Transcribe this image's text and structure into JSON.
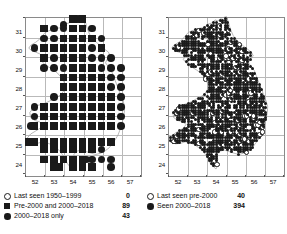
{
  "figure": {
    "type": "distribution-map-pair"
  },
  "maps": [
    {
      "id": "left-map",
      "name": "left-distribution-map",
      "axis": {
        "x_ticks": [
          "52",
          "53",
          "54",
          "55",
          "56",
          "57"
        ],
        "y_ticks": [
          "31",
          "30",
          "29",
          "28",
          "27",
          "26",
          "25",
          "24"
        ],
        "xlim": [
          51.5,
          57.5
        ],
        "ylim": [
          23.5,
          31.6
        ],
        "grid": true
      },
      "legend": [
        {
          "symbol": "open-circle",
          "label": "Last seen 1950–1999",
          "count": "0"
        },
        {
          "symbol": "filled-square",
          "label": "Pre-2000 and 2000–2018",
          "count": "89"
        },
        {
          "symbol": "filled-circle",
          "label": "2000–2018 only",
          "count": "43"
        }
      ]
    },
    {
      "id": "right-map",
      "name": "right-distribution-map",
      "axis": {
        "x_ticks": [
          "52",
          "53",
          "54",
          "55",
          "56",
          "57"
        ],
        "y_ticks": [
          "31",
          "30",
          "29",
          "28",
          "27",
          "26",
          "25",
          "24"
        ],
        "xlim": [
          51.5,
          57.5
        ],
        "ylim": [
          23.5,
          31.6
        ],
        "grid": true
      },
      "legend": [
        {
          "symbol": "open-circle",
          "label": "Last seen pre-2000",
          "count": "40"
        },
        {
          "symbol": "filled-circle",
          "label": "Seen 2000–2018",
          "count": "394"
        }
      ]
    }
  ],
  "chart_data": {
    "type": "scatter",
    "title": "",
    "xlabel": "",
    "ylabel": "",
    "xlim": [
      51.5,
      57.5
    ],
    "ylim": [
      23.5,
      31.6
    ],
    "grid": true,
    "panels": [
      {
        "name": "left-map",
        "series": [
          {
            "name": "Last seen 1950–1999",
            "symbol": "open-circle",
            "count": 0,
            "points": []
          },
          {
            "name": "Pre-2000 and 2000–2018",
            "symbol": "filled-square",
            "count": 89,
            "points": [
              [
                54.0,
                31.5
              ],
              [
                54.5,
                31.5
              ],
              [
                52.5,
                31.0
              ],
              [
                54.0,
                31.0
              ],
              [
                54.5,
                31.0
              ],
              [
                53.5,
                30.5
              ],
              [
                54.0,
                30.5
              ],
              [
                54.5,
                30.5
              ],
              [
                55.0,
                30.5
              ],
              [
                52.5,
                30.0
              ],
              [
                53.0,
                30.0
              ],
              [
                53.5,
                30.0
              ],
              [
                54.0,
                30.0
              ],
              [
                54.5,
                30.0
              ],
              [
                55.5,
                30.0
              ],
              [
                52.5,
                29.5
              ],
              [
                53.5,
                29.5
              ],
              [
                54.0,
                29.5
              ],
              [
                54.5,
                29.5
              ],
              [
                54.0,
                29.0
              ],
              [
                54.5,
                29.0
              ],
              [
                55.0,
                29.0
              ],
              [
                53.5,
                28.5
              ],
              [
                54.0,
                28.5
              ],
              [
                54.5,
                28.5
              ],
              [
                55.0,
                28.5
              ],
              [
                55.5,
                28.5
              ],
              [
                53.5,
                28.0
              ],
              [
                54.0,
                28.0
              ],
              [
                54.5,
                28.0
              ],
              [
                55.0,
                28.0
              ],
              [
                55.5,
                28.0
              ],
              [
                53.5,
                27.5
              ],
              [
                54.0,
                27.5
              ],
              [
                54.5,
                27.5
              ],
              [
                55.0,
                27.5
              ],
              [
                55.5,
                27.5
              ],
              [
                56.0,
                27.5
              ],
              [
                52.5,
                27.0
              ],
              [
                53.0,
                27.0
              ],
              [
                53.5,
                27.0
              ],
              [
                54.0,
                27.0
              ],
              [
                54.5,
                27.0
              ],
              [
                55.0,
                27.0
              ],
              [
                55.5,
                27.0
              ],
              [
                56.0,
                27.0
              ],
              [
                52.5,
                26.5
              ],
              [
                53.0,
                26.5
              ],
              [
                53.5,
                26.5
              ],
              [
                54.0,
                26.5
              ],
              [
                54.5,
                26.5
              ],
              [
                55.0,
                26.5
              ],
              [
                55.5,
                26.5
              ],
              [
                56.0,
                26.5
              ],
              [
                52.0,
                26.0
              ],
              [
                52.5,
                26.0
              ],
              [
                53.0,
                26.0
              ],
              [
                53.5,
                26.0
              ],
              [
                54.0,
                26.0
              ],
              [
                54.5,
                26.0
              ],
              [
                55.0,
                26.0
              ],
              [
                55.5,
                26.0
              ],
              [
                56.0,
                26.0
              ],
              [
                51.7,
                25.2
              ],
              [
                52.0,
                25.2
              ],
              [
                52.5,
                25.2
              ],
              [
                53.0,
                25.2
              ],
              [
                53.5,
                25.2
              ],
              [
                54.0,
                25.2
              ],
              [
                54.5,
                25.2
              ],
              [
                55.0,
                25.2
              ],
              [
                55.5,
                25.2
              ],
              [
                56.0,
                25.2
              ],
              [
                52.5,
                24.8
              ],
              [
                53.0,
                24.8
              ],
              [
                53.5,
                24.8
              ],
              [
                54.0,
                24.8
              ],
              [
                54.5,
                24.8
              ],
              [
                55.0,
                24.8
              ],
              [
                52.5,
                24.3
              ],
              [
                53.0,
                24.3
              ],
              [
                53.5,
                24.3
              ],
              [
                54.0,
                24.3
              ],
              [
                54.5,
                24.3
              ],
              [
                53.0,
                23.9
              ],
              [
                53.3,
                23.9
              ],
              [
                54.0,
                23.9
              ],
              [
                54.5,
                23.9
              ],
              [
                55.0,
                23.9
              ]
            ]
          },
          {
            "name": "2000–2018 only",
            "symbol": "filled-circle",
            "count": 43,
            "points": [
              [
                54.25,
                31.5
              ],
              [
                53.5,
                31.2
              ],
              [
                53.0,
                31.0
              ],
              [
                53.5,
                31.0
              ],
              [
                55.0,
                31.0
              ],
              [
                52.5,
                30.5
              ],
              [
                53.0,
                30.5
              ],
              [
                55.5,
                30.5
              ],
              [
                52.0,
                30.0
              ],
              [
                55.0,
                30.0
              ],
              [
                53.0,
                29.5
              ],
              [
                55.0,
                29.5
              ],
              [
                55.5,
                29.5
              ],
              [
                56.0,
                29.5
              ],
              [
                52.5,
                29.0
              ],
              [
                53.0,
                29.0
              ],
              [
                53.5,
                29.0
              ],
              [
                55.5,
                29.0
              ],
              [
                56.0,
                29.0
              ],
              [
                56.5,
                29.0
              ],
              [
                56.0,
                28.5
              ],
              [
                56.5,
                28.5
              ],
              [
                56.0,
                28.0
              ],
              [
                56.5,
                28.0
              ],
              [
                53.0,
                27.5
              ],
              [
                56.5,
                27.5
              ],
              [
                52.0,
                27.0
              ],
              [
                56.5,
                27.0
              ],
              [
                52.0,
                26.5
              ],
              [
                56.5,
                26.5
              ],
              [
                51.8,
                26.0
              ],
              [
                56.5,
                26.0
              ],
              [
                56.0,
                25.2
              ],
              [
                53.5,
                24.8
              ],
              [
                54.0,
                24.8
              ],
              [
                55.0,
                24.8
              ],
              [
                55.5,
                24.8
              ],
              [
                53.0,
                24.3
              ],
              [
                55.0,
                24.3
              ],
              [
                55.5,
                24.3
              ],
              [
                56.0,
                24.3
              ],
              [
                56.0,
                23.9
              ],
              [
                54.7,
                24.3
              ]
            ]
          }
        ]
      },
      {
        "name": "right-map",
        "series": [
          {
            "name": "Last seen pre-2000",
            "symbol": "open-circle",
            "count": 40
          },
          {
            "name": "Seen 2000–2018",
            "symbol": "filled-circle",
            "count": 394
          }
        ]
      }
    ]
  }
}
